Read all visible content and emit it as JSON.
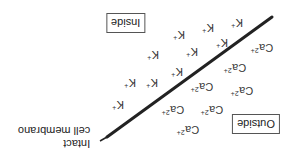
{
  "diagram": {
    "orientation": "rotated-180",
    "membrane": {
      "label_line1": "Intact",
      "label_line2": "cell membrano",
      "line": {
        "x1": 107,
        "y1": 137,
        "x2": 272,
        "y2": 17
      },
      "pointer": {
        "x1": 100,
        "y1": 141,
        "x2": 107,
        "y2": 137
      },
      "color": "#222222"
    },
    "regions": {
      "inside": {
        "label": "Inside"
      },
      "outside": {
        "label": "Outside"
      }
    },
    "ions": {
      "potassium": {
        "symbol": "K",
        "charge": "+",
        "positions": [
          {
            "x": 237,
            "y": 23
          },
          {
            "x": 208,
            "y": 28
          },
          {
            "x": 179,
            "y": 35
          },
          {
            "x": 222,
            "y": 43
          },
          {
            "x": 192,
            "y": 52
          },
          {
            "x": 153,
            "y": 55
          },
          {
            "x": 177,
            "y": 72
          },
          {
            "x": 152,
            "y": 83
          },
          {
            "x": 130,
            "y": 83
          },
          {
            "x": 118,
            "y": 105
          }
        ]
      },
      "calcium": {
        "symbol": "Ca",
        "charge": "2+",
        "positions": [
          {
            "x": 262,
            "y": 48
          },
          {
            "x": 235,
            "y": 68
          },
          {
            "x": 202,
            "y": 87
          },
          {
            "x": 242,
            "y": 91
          },
          {
            "x": 173,
            "y": 110
          },
          {
            "x": 212,
            "y": 110
          },
          {
            "x": 188,
            "y": 130
          }
        ]
      }
    }
  }
}
